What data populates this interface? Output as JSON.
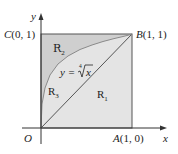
{
  "diagram": {
    "axes": {
      "x_label": "x",
      "y_label": "y",
      "origin_label": "O"
    },
    "points": {
      "A": {
        "name": "A",
        "coords": "(1, 0)"
      },
      "B": {
        "name": "B",
        "coords": "(1, 1)"
      },
      "C": {
        "name": "C",
        "coords": "(0, 1)"
      }
    },
    "curve": {
      "equation_lhs": "y = ",
      "root_index": "4",
      "radicand": "x"
    },
    "regions": [
      {
        "name": "R",
        "sub": "1"
      },
      {
        "name": "R",
        "sub": "2"
      },
      {
        "name": "R",
        "sub": "3"
      }
    ],
    "colors": {
      "region_light": "#e4e4e4",
      "region_dark": "#cfcfcf",
      "line": "#555555",
      "curve": "#8a8a8a"
    }
  }
}
